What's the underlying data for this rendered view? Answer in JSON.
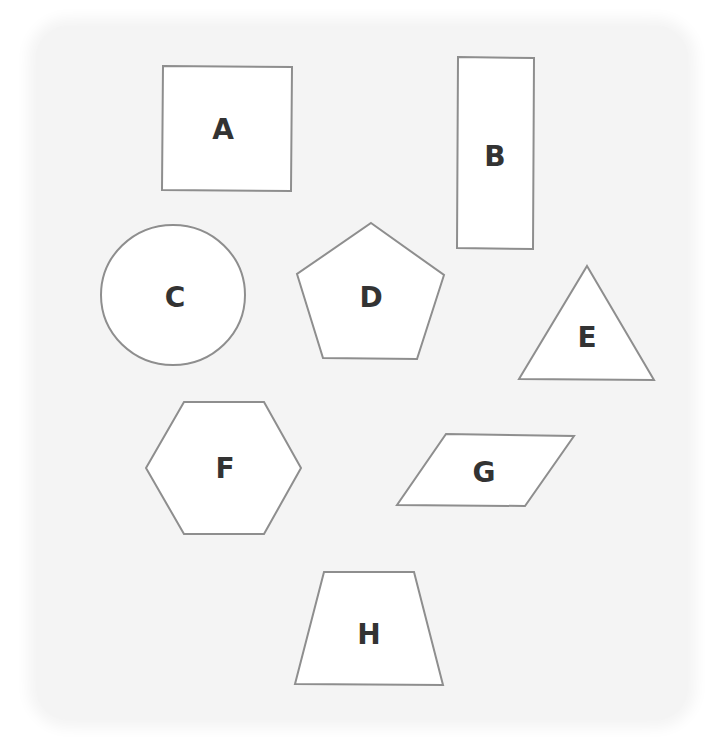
{
  "diagram": {
    "background_color": "#f4f4f4",
    "shape_fill": "#ffffff",
    "shape_stroke": "#8e8e8e",
    "label_color": "#333333",
    "shapes": [
      {
        "id": "A",
        "label": "A",
        "type": "square"
      },
      {
        "id": "B",
        "label": "B",
        "type": "rectangle"
      },
      {
        "id": "C",
        "label": "C",
        "type": "circle"
      },
      {
        "id": "D",
        "label": "D",
        "type": "pentagon"
      },
      {
        "id": "E",
        "label": "E",
        "type": "triangle"
      },
      {
        "id": "F",
        "label": "F",
        "type": "hexagon"
      },
      {
        "id": "G",
        "label": "G",
        "type": "parallelogram"
      },
      {
        "id": "H",
        "label": "H",
        "type": "trapezoid"
      }
    ]
  }
}
